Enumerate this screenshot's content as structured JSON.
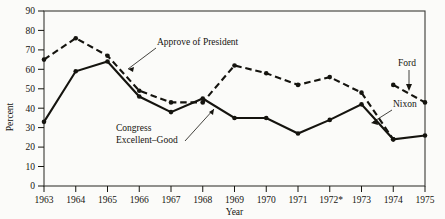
{
  "chart_data": {
    "type": "line",
    "title": "",
    "xlabel": "Year",
    "ylabel": "Percent",
    "xlim": [
      1963,
      1975
    ],
    "ylim": [
      0,
      90
    ],
    "grid": false,
    "legend_position": "inline-annotations",
    "x": [
      1963,
      1964,
      1965,
      1966,
      1967,
      1968,
      1969,
      1970,
      1971,
      1972,
      1973,
      1974,
      1975
    ],
    "xtick_labels": [
      "1963",
      "1964",
      "1965",
      "1966",
      "1967",
      "1968",
      "1969",
      "1970",
      "1971",
      "1972*",
      "1973",
      "1974",
      "1975"
    ],
    "ytick_labels": [
      "0",
      "10",
      "20",
      "30",
      "40",
      "50",
      "60",
      "70",
      "80",
      "90"
    ],
    "ytick_values": [
      0,
      10,
      20,
      30,
      40,
      50,
      60,
      70,
      80,
      90
    ],
    "series": [
      {
        "name": "Approve of President",
        "style": "dashed",
        "marker": "filled-circle",
        "x": [
          1963,
          1964,
          1965,
          1966,
          1967,
          1968,
          1969,
          1970,
          1971,
          1972,
          1973,
          1974
        ],
        "values": [
          65,
          76,
          67,
          49,
          43,
          43,
          62,
          58,
          52,
          56,
          48,
          24
        ]
      },
      {
        "name": "Congress Excellent-Good",
        "style": "solid",
        "marker": "filled-circle",
        "x": [
          1963,
          1964,
          1965,
          1966,
          1967,
          1968,
          1969,
          1970,
          1971,
          1972,
          1973,
          1974,
          1975
        ],
        "values": [
          33,
          59,
          64,
          46,
          38,
          45,
          35,
          35,
          27,
          34,
          42,
          24,
          26
        ]
      },
      {
        "name": "Ford",
        "style": "dashed",
        "marker": "filled-circle",
        "x": [
          1974,
          1975
        ],
        "values": [
          52,
          43
        ]
      }
    ],
    "annotations": [
      {
        "text": "Approve of President",
        "points_to_series": "Approve of President"
      },
      {
        "text": "Congress",
        "points_to_series": "Congress Excellent-Good"
      },
      {
        "text": "Excellent–Good",
        "points_to_series": "Congress Excellent-Good"
      },
      {
        "text": "Ford",
        "points_to_series": "Ford"
      },
      {
        "text": "Nixon",
        "points_to_series": "Approve of President"
      }
    ]
  },
  "axes": {
    "y_title": "Percent",
    "x_title": "Year"
  },
  "labels": {
    "approve_of_president": "Approve of President",
    "congress": "Congress",
    "excellent_good": "Excellent–Good",
    "ford": "Ford",
    "nixon": "Nixon"
  },
  "ytick_labels": {
    "t0": "0",
    "t1": "10",
    "t2": "20",
    "t3": "30",
    "t4": "40",
    "t5": "50",
    "t6": "60",
    "t7": "70",
    "t8": "80",
    "t9": "90"
  },
  "xtick_labels": {
    "t0": "1963",
    "t1": "1964",
    "t2": "1965",
    "t3": "1966",
    "t4": "1967",
    "t5": "1968",
    "t6": "1969",
    "t7": "1970",
    "t8": "1971",
    "t9": "1972*",
    "t10": "1973",
    "t11": "1974",
    "t12": "1975"
  },
  "colors": {
    "ink": "#15140f",
    "background": "#fbfbf9",
    "frame": "#3a3a36"
  }
}
